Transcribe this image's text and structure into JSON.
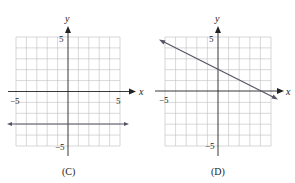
{
  "graphs": [
    {
      "id": "C",
      "caption": "(C)",
      "x_axis_label": "x",
      "y_axis_label": "y",
      "tick_labels": {
        "x_min": "−5",
        "x_max": "5",
        "y_max": "5",
        "y_min": "−5"
      },
      "grid": {
        "x_range": [
          -5,
          5
        ],
        "y_range": [
          -5,
          5
        ],
        "step": 1
      },
      "line": {
        "type": "horizontal",
        "equation": "y = -3",
        "slope": 0,
        "intercept": -3
      }
    },
    {
      "id": "D",
      "caption": "(D)",
      "x_axis_label": "x",
      "y_axis_label": "y",
      "tick_labels": {
        "x_min": "−5",
        "y_max": "5",
        "y_min": "−5"
      },
      "grid": {
        "x_range": [
          -5,
          5
        ],
        "y_range": [
          -5,
          5
        ],
        "step": 1
      },
      "line": {
        "type": "linear",
        "equation": "y = -x/2 + 2",
        "slope": -0.5,
        "intercept": 2
      }
    }
  ],
  "colors": {
    "grid": "#b8b8b8",
    "axis": "#222222",
    "line": "#555566"
  }
}
